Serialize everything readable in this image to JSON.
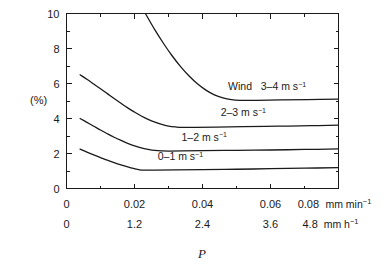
{
  "chart_data": {
    "type": "line",
    "title": "",
    "xlabel": "P",
    "ylabel": "(%)",
    "xlim": [
      0,
      0.08
    ],
    "ylim": [
      0,
      10
    ],
    "grid": false,
    "legend_position": "inline-right-of-curves",
    "y_axis": {
      "label": "(%)",
      "ticks": [
        0,
        2,
        4,
        6,
        8,
        10
      ],
      "tick_labels": [
        "0",
        "2",
        "4",
        "6",
        "8",
        "10"
      ],
      "minor_tick_step": 1
    },
    "x_axis_primary": {
      "unit": "mm min",
      "unit_exponent": "-1",
      "ticks": [
        0,
        0.02,
        0.04,
        0.06,
        0.08
      ],
      "tick_labels": [
        "0",
        "0.02",
        "0.04",
        "0.06",
        "0.08"
      ],
      "unit_label_text": "mm min",
      "minor_tick_step": 0.01
    },
    "x_axis_secondary": {
      "unit": "mm h",
      "unit_exponent": "-1",
      "ticks": [
        0,
        1.2,
        2.4,
        3.6,
        4.8
      ],
      "tick_labels": [
        "0",
        "1.2",
        "2.4",
        "3.6",
        "4.8"
      ],
      "unit_label_text": "mm h"
    },
    "series": [
      {
        "name": "0-1 m s-1",
        "label_prefix": "",
        "label_range": "0–1 m s",
        "label_exponent": "−1",
        "label_x": 0.0335,
        "label_y": 1.62,
        "points": [
          [
            0.004,
            2.25
          ],
          [
            0.006,
            2.08
          ],
          [
            0.008,
            1.92
          ],
          [
            0.01,
            1.77
          ],
          [
            0.012,
            1.62
          ],
          [
            0.014,
            1.48
          ],
          [
            0.016,
            1.35
          ],
          [
            0.018,
            1.23
          ],
          [
            0.02,
            1.13
          ],
          [
            0.0215,
            1.07
          ],
          [
            0.023,
            1.05
          ],
          [
            0.026,
            1.05
          ],
          [
            0.032,
            1.06
          ],
          [
            0.04,
            1.08
          ],
          [
            0.05,
            1.1
          ],
          [
            0.06,
            1.13
          ],
          [
            0.07,
            1.16
          ],
          [
            0.08,
            1.19
          ]
        ]
      },
      {
        "name": "1-2 m s-1",
        "label_prefix": "",
        "label_range": "1–2 m s",
        "label_exponent": "−1",
        "label_x": 0.0405,
        "label_y": 2.72,
        "points": [
          [
            0.004,
            4.0
          ],
          [
            0.006,
            3.78
          ],
          [
            0.008,
            3.56
          ],
          [
            0.01,
            3.34
          ],
          [
            0.012,
            3.13
          ],
          [
            0.014,
            2.93
          ],
          [
            0.016,
            2.75
          ],
          [
            0.018,
            2.58
          ],
          [
            0.02,
            2.44
          ],
          [
            0.022,
            2.32
          ],
          [
            0.024,
            2.24
          ],
          [
            0.026,
            2.18
          ],
          [
            0.028,
            2.15
          ],
          [
            0.03,
            2.14
          ],
          [
            0.034,
            2.15
          ],
          [
            0.04,
            2.16
          ],
          [
            0.05,
            2.18
          ],
          [
            0.06,
            2.2
          ],
          [
            0.07,
            2.23
          ],
          [
            0.08,
            2.26
          ]
        ]
      },
      {
        "name": "2-3 m s-1",
        "label_prefix": "",
        "label_range": "2–3 m s",
        "label_exponent": "−1",
        "label_x": 0.052,
        "label_y": 4.12,
        "points": [
          [
            0.004,
            6.5
          ],
          [
            0.006,
            6.24
          ],
          [
            0.008,
            5.97
          ],
          [
            0.01,
            5.7
          ],
          [
            0.012,
            5.42
          ],
          [
            0.014,
            5.14
          ],
          [
            0.016,
            4.87
          ],
          [
            0.018,
            4.61
          ],
          [
            0.02,
            4.37
          ],
          [
            0.022,
            4.14
          ],
          [
            0.024,
            3.95
          ],
          [
            0.026,
            3.79
          ],
          [
            0.028,
            3.66
          ],
          [
            0.03,
            3.57
          ],
          [
            0.032,
            3.52
          ],
          [
            0.034,
            3.49
          ],
          [
            0.038,
            3.49
          ],
          [
            0.044,
            3.51
          ],
          [
            0.052,
            3.53
          ],
          [
            0.062,
            3.56
          ],
          [
            0.072,
            3.59
          ],
          [
            0.08,
            3.62
          ]
        ]
      },
      {
        "name": "3-4 m s-1",
        "label_prefix": "Wind",
        "label_range": "3–4 m s",
        "label_exponent": "−1",
        "label_x": 0.059,
        "label_y": 5.62,
        "clipped_at_top": true,
        "points": [
          [
            0.0232,
            10.0
          ],
          [
            0.026,
            9.06
          ],
          [
            0.0285,
            8.3
          ],
          [
            0.031,
            7.6
          ],
          [
            0.0335,
            6.98
          ],
          [
            0.036,
            6.44
          ],
          [
            0.0385,
            5.98
          ],
          [
            0.041,
            5.62
          ],
          [
            0.0435,
            5.35
          ],
          [
            0.046,
            5.18
          ],
          [
            0.0485,
            5.08
          ],
          [
            0.051,
            5.04
          ],
          [
            0.056,
            5.04
          ],
          [
            0.063,
            5.06
          ],
          [
            0.071,
            5.08
          ],
          [
            0.08,
            5.11
          ]
        ]
      }
    ]
  },
  "labels": {
    "y_axis_unit": "(%)",
    "x_axis_title": "P",
    "unit_primary": "mm min",
    "unit_secondary": "mm h",
    "superscript_minus_one": "−1"
  },
  "colors": {
    "curve": "#1a1a1a",
    "axis": "#1a1a1a",
    "background": "#ffffff"
  }
}
